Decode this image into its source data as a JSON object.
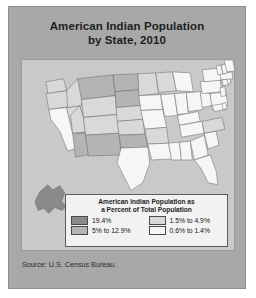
{
  "figure": {
    "title_line1": "American Indian Population",
    "title_line2": "by State, 2010",
    "source": "Source: U.S. Census Bureau.",
    "card_bg": "#a8a8a8",
    "map_bg": "#c9c9c9"
  },
  "legend": {
    "title_line1": "American Indian Population as",
    "title_line2": "a Percent of Total Population",
    "entries": [
      {
        "label": "19.4%",
        "color": "#8a8a8a"
      },
      {
        "label": "1.5% to 4.9%",
        "color": "#d9d9d9"
      },
      {
        "label": "5% to 12.9%",
        "color": "#b4b4b4"
      },
      {
        "label": "0.6% to 1.4%",
        "color": "#f6f6f6"
      }
    ]
  },
  "chart_data": {
    "type": "map",
    "title": "American Indian Population by State, 2010",
    "subtitle": "American Indian Population as a Percent of Total Population",
    "source": "Source: U.S. Census Bureau.",
    "value_label": "American Indian and Alaska Native alone, percent of total state population",
    "legend_position": "inside-bottom-center",
    "bins": [
      {
        "label": "19.4%",
        "min": 19.4,
        "max": 19.4,
        "color": "#8a8a8a"
      },
      {
        "label": "5% to 12.9%",
        "min": 5.0,
        "max": 12.9,
        "color": "#b4b4b4"
      },
      {
        "label": "1.5% to 4.9%",
        "min": 1.5,
        "max": 4.9,
        "color": "#d9d9d9"
      },
      {
        "label": "0.6% to 1.4%",
        "min": 0.6,
        "max": 1.4,
        "color": "#f6f6f6"
      }
    ],
    "regions": [
      {
        "code": "AK",
        "name": "Alaska",
        "bin": "19.4%"
      },
      {
        "code": "OK",
        "name": "Oklahoma",
        "bin": "5% to 12.9%"
      },
      {
        "code": "NM",
        "name": "New Mexico",
        "bin": "5% to 12.9%"
      },
      {
        "code": "SD",
        "name": "South Dakota",
        "bin": "5% to 12.9%"
      },
      {
        "code": "MT",
        "name": "Montana",
        "bin": "5% to 12.9%"
      },
      {
        "code": "ND",
        "name": "North Dakota",
        "bin": "5% to 12.9%"
      },
      {
        "code": "AZ",
        "name": "Arizona",
        "bin": "5% to 12.9%"
      },
      {
        "code": "WY",
        "name": "Wyoming",
        "bin": "1.5% to 4.9%"
      },
      {
        "code": "WA",
        "name": "Washington",
        "bin": "1.5% to 4.9%"
      },
      {
        "code": "OR",
        "name": "Oregon",
        "bin": "1.5% to 4.9%"
      },
      {
        "code": "ID",
        "name": "Idaho",
        "bin": "1.5% to 4.9%"
      },
      {
        "code": "NV",
        "name": "Nevada",
        "bin": "1.5% to 4.9%"
      },
      {
        "code": "UT",
        "name": "Utah",
        "bin": "1.5% to 4.9%"
      },
      {
        "code": "CO",
        "name": "Colorado",
        "bin": "1.5% to 4.9%"
      },
      {
        "code": "NE",
        "name": "Nebraska",
        "bin": "1.5% to 4.9%"
      },
      {
        "code": "KS",
        "name": "Kansas",
        "bin": "1.5% to 4.9%"
      },
      {
        "code": "MN",
        "name": "Minnesota",
        "bin": "1.5% to 4.9%"
      },
      {
        "code": "WI",
        "name": "Wisconsin",
        "bin": "1.5% to 4.9%"
      },
      {
        "code": "NC",
        "name": "North Carolina",
        "bin": "1.5% to 4.9%"
      },
      {
        "code": "AR",
        "name": "Arkansas",
        "bin": "1.5% to 4.9%"
      },
      {
        "code": "CA",
        "name": "California",
        "bin": "0.6% to 1.4%"
      },
      {
        "code": "TX",
        "name": "Texas",
        "bin": "0.6% to 1.4%"
      },
      {
        "code": "MO",
        "name": "Missouri",
        "bin": "0.6% to 1.4%"
      },
      {
        "code": "IA",
        "name": "Iowa",
        "bin": "0.6% to 1.4%"
      },
      {
        "code": "IL",
        "name": "Illinois",
        "bin": "0.6% to 1.4%"
      },
      {
        "code": "MI",
        "name": "Michigan",
        "bin": "0.6% to 1.4%"
      },
      {
        "code": "IN",
        "name": "Indiana",
        "bin": "0.6% to 1.4%"
      },
      {
        "code": "OH",
        "name": "Ohio",
        "bin": "0.6% to 1.4%"
      },
      {
        "code": "KY",
        "name": "Kentucky",
        "bin": "0.6% to 1.4%"
      },
      {
        "code": "TN",
        "name": "Tennessee",
        "bin": "0.6% to 1.4%"
      },
      {
        "code": "MS",
        "name": "Mississippi",
        "bin": "0.6% to 1.4%"
      },
      {
        "code": "AL",
        "name": "Alabama",
        "bin": "0.6% to 1.4%"
      },
      {
        "code": "GA",
        "name": "Georgia",
        "bin": "0.6% to 1.4%"
      },
      {
        "code": "FL",
        "name": "Florida",
        "bin": "0.6% to 1.4%"
      },
      {
        "code": "SC",
        "name": "South Carolina",
        "bin": "0.6% to 1.4%"
      },
      {
        "code": "VA",
        "name": "Virginia",
        "bin": "0.6% to 1.4%"
      },
      {
        "code": "WV",
        "name": "West Virginia",
        "bin": "0.6% to 1.4%"
      },
      {
        "code": "MD",
        "name": "Maryland",
        "bin": "0.6% to 1.4%"
      },
      {
        "code": "DE",
        "name": "Delaware",
        "bin": "0.6% to 1.4%"
      },
      {
        "code": "NJ",
        "name": "New Jersey",
        "bin": "0.6% to 1.4%"
      },
      {
        "code": "PA",
        "name": "Pennsylvania",
        "bin": "0.6% to 1.4%"
      },
      {
        "code": "NY",
        "name": "New York",
        "bin": "0.6% to 1.4%"
      },
      {
        "code": "CT",
        "name": "Connecticut",
        "bin": "0.6% to 1.4%"
      },
      {
        "code": "RI",
        "name": "Rhode Island",
        "bin": "0.6% to 1.4%"
      },
      {
        "code": "MA",
        "name": "Massachusetts",
        "bin": "0.6% to 1.4%"
      },
      {
        "code": "VT",
        "name": "Vermont",
        "bin": "0.6% to 1.4%"
      },
      {
        "code": "NH",
        "name": "New Hampshire",
        "bin": "0.6% to 1.4%"
      },
      {
        "code": "ME",
        "name": "Maine",
        "bin": "0.6% to 1.4%"
      },
      {
        "code": "LA",
        "name": "Louisiana",
        "bin": "0.6% to 1.4%"
      },
      {
        "code": "HI",
        "name": "Hawaii",
        "bin": "0.6% to 1.4%"
      }
    ]
  }
}
